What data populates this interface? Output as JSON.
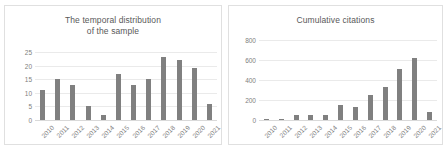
{
  "figure": {
    "background": "#ffffff",
    "bar_color": "#808080",
    "grid_color": "#eaeaea",
    "text_color": "#808080",
    "title_color": "#595959"
  },
  "left_chart": {
    "title_line1": "The temporal distribution",
    "title_line2": "of the sample"
  },
  "right_chart": {
    "title": "Cumulative citations"
  },
  "chart_data": [
    {
      "type": "bar",
      "title": "The temporal distribution of the sample",
      "xlabel": "",
      "ylabel": "",
      "categories": [
        "2010",
        "2011",
        "2012",
        "2013",
        "2014",
        "2015",
        "2016",
        "2017",
        "2018",
        "2019",
        "2020",
        "2021"
      ],
      "values": [
        11,
        15,
        13,
        5,
        2,
        17,
        13,
        15,
        23,
        22,
        19,
        6
      ],
      "ylim": [
        0,
        25
      ],
      "yticks": [
        0,
        5,
        10,
        15,
        20,
        25
      ],
      "ytick_labels": [
        "0",
        "5",
        "10",
        "15",
        "20",
        "25"
      ],
      "grid": true,
      "legend": false
    },
    {
      "type": "bar",
      "title": "Cumulative citations",
      "xlabel": "",
      "ylabel": "",
      "categories": [
        "2010",
        "2011",
        "2012",
        "2013",
        "2014",
        "2015",
        "2016",
        "2017",
        "2018",
        "2019",
        "2020",
        "2021"
      ],
      "values": [
        0,
        10,
        55,
        50,
        50,
        150,
        135,
        250,
        330,
        510,
        625,
        85
      ],
      "ylim": [
        0,
        800
      ],
      "yticks": [
        0,
        200,
        400,
        600,
        800
      ],
      "ytick_labels": [
        "0",
        "200",
        "400",
        "600",
        "800"
      ],
      "grid": true,
      "legend": false
    }
  ]
}
